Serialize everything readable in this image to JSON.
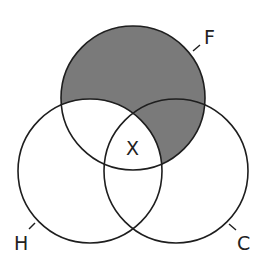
{
  "diagram": {
    "type": "venn",
    "sets": [
      {
        "id": "F",
        "label": "F",
        "cx": 133,
        "cy": 98,
        "r": 72
      },
      {
        "id": "H",
        "label": "H",
        "cx": 90,
        "cy": 171,
        "r": 72
      },
      {
        "id": "C",
        "label": "C",
        "cx": 176,
        "cy": 171,
        "r": 72
      }
    ],
    "center_label": "X",
    "shaded_region": "F minus H",
    "colors": {
      "shade": "#7a7a7a",
      "stroke": "#1e1e1e",
      "background": "#ffffff"
    }
  }
}
